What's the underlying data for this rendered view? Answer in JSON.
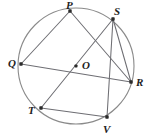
{
  "figure": {
    "type": "circle-geometry-diagram",
    "background_color": "#ffffff",
    "stroke_color": "#6e6e73",
    "circle_color": "#8a8a8a",
    "dot_color": "#2b2b2b",
    "circle": {
      "center_label": "O",
      "center_x": 76,
      "center_y": 66,
      "radius": 58
    },
    "labels": {
      "P": "P",
      "S": "S",
      "Q": "Q",
      "O": "O",
      "R": "R",
      "T": "T",
      "V": "V"
    },
    "points": [
      {
        "name": "P",
        "x": 70,
        "y": 11,
        "label_x": 66,
        "label_y": 0,
        "on_circle": true
      },
      {
        "name": "S",
        "x": 113,
        "y": 19,
        "label_x": 114,
        "label_y": 6,
        "on_circle": true
      },
      {
        "name": "Q",
        "x": 21,
        "y": 64,
        "label_x": 8,
        "label_y": 58,
        "on_circle": true
      },
      {
        "name": "O",
        "x": 76,
        "y": 66,
        "label_x": 82,
        "label_y": 60,
        "on_circle": false
      },
      {
        "name": "R",
        "x": 131,
        "y": 82,
        "label_x": 136,
        "label_y": 77,
        "on_circle": true
      },
      {
        "name": "T",
        "x": 41,
        "y": 108,
        "label_x": 28,
        "label_y": 105,
        "on_circle": true
      },
      {
        "name": "V",
        "x": 107,
        "y": 117,
        "label_x": 103,
        "label_y": 124,
        "on_circle": true
      }
    ],
    "chords": [
      {
        "name": "chord-P-Q",
        "from": "P",
        "to": "Q"
      },
      {
        "name": "chord-P-R",
        "from": "P",
        "to": "R"
      },
      {
        "name": "chord-Q-R",
        "from": "Q",
        "to": "R",
        "is_diameter": true
      },
      {
        "name": "chord-S-T",
        "from": "S",
        "to": "T"
      },
      {
        "name": "chord-S-R",
        "from": "S",
        "to": "R"
      },
      {
        "name": "chord-S-V",
        "from": "S",
        "to": "V"
      },
      {
        "name": "chord-T-V",
        "from": "T",
        "to": "V"
      }
    ]
  }
}
